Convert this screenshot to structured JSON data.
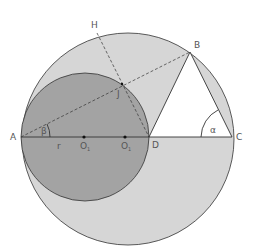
{
  "diagram": {
    "points": {
      "A": "A",
      "B": "B",
      "C": "C",
      "D": "D",
      "H": "H",
      "J": "J",
      "O1a": "O",
      "O1b": "O"
    },
    "subscripts": {
      "O1a": "1",
      "O1b": "1"
    },
    "angles": {
      "alpha": "α",
      "beta": "β"
    },
    "segment_label": "r",
    "colors": {
      "big_circle_fill": "#d6d6d6",
      "small_circle_fill": "#a3a3a3",
      "triangle_fill": "#ffffff",
      "stroke": "#333333"
    }
  }
}
